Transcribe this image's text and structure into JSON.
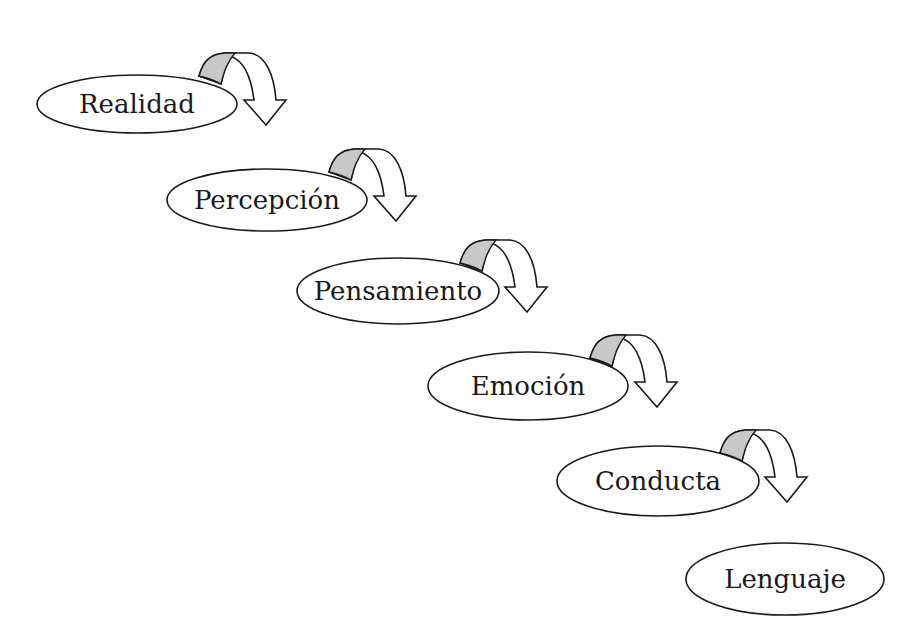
{
  "diagram": {
    "title": "",
    "colors": {
      "stroke": "#1a1a1a",
      "node_fill": "#ffffff",
      "arrow_band": "#c8c8c8",
      "background": "#ffffff"
    },
    "nodes": [
      {
        "id": "realidad",
        "label": "Realidad",
        "has_arrow": true
      },
      {
        "id": "percepcion",
        "label": "Percepción",
        "has_arrow": true
      },
      {
        "id": "pensamiento",
        "label": "Pensamiento",
        "has_arrow": true
      },
      {
        "id": "emocion",
        "label": "Emoción",
        "has_arrow": true
      },
      {
        "id": "conducta",
        "label": "Conducta",
        "has_arrow": true
      },
      {
        "id": "lenguaje",
        "label": "Lenguaje",
        "has_arrow": false
      }
    ],
    "edges": [
      {
        "from": "realidad",
        "to": "percepcion",
        "icon": "curved-arrow-down-icon"
      },
      {
        "from": "percepcion",
        "to": "pensamiento",
        "icon": "curved-arrow-down-icon"
      },
      {
        "from": "pensamiento",
        "to": "emocion",
        "icon": "curved-arrow-down-icon"
      },
      {
        "from": "emocion",
        "to": "conducta",
        "icon": "curved-arrow-down-icon"
      },
      {
        "from": "conducta",
        "to": "lenguaje",
        "icon": "curved-arrow-down-icon"
      }
    ]
  }
}
